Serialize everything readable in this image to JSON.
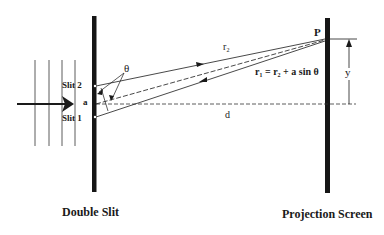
{
  "diagram": {
    "colors": {
      "ink": "#1a1a1a",
      "bar": "#161616",
      "background": "#ffffff"
    },
    "labels": {
      "slit2": "Slit 2",
      "slit1": "Slit 1",
      "slit_separation": "a",
      "theta": "θ",
      "r2": "r₂",
      "path_relation": "r₁ = r₂ + a sin θ",
      "point": "P",
      "y": "y",
      "distance": "d",
      "double_slit_caption": "Double Slit",
      "screen_caption": "Projection Screen"
    },
    "elements": {
      "incident_wavefronts": 4,
      "incident_arrow": "right",
      "rays": [
        "slit 2 to P (solid, arrow)",
        "center to P (dashed)",
        "slit 1 to P (solid, arrow)"
      ],
      "center_axis": "dashed horizontal from slit center to screen"
    }
  }
}
